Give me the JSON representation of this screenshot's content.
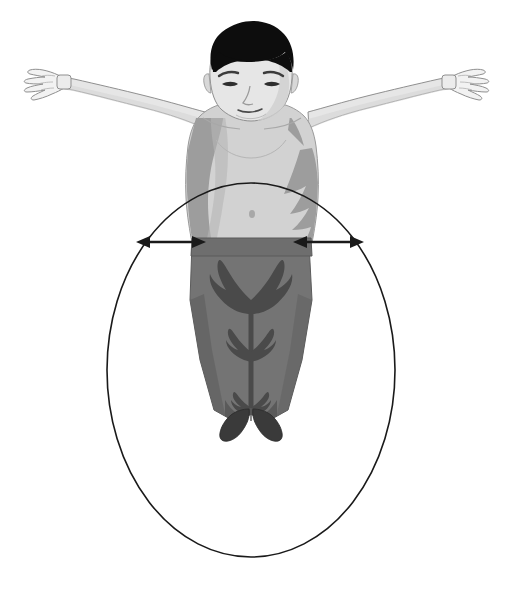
{
  "figure": {
    "alt_text": "Grayscale line illustration of a man with arms outstretched horizontally, bare torso and dark trousers, with an ellipse outlining his lower body and two horizontal double-headed arrows across his hips.",
    "background_color": "#ffffff",
    "outline_color": "#1a1a1a"
  },
  "figure_elements": {
    "person": {
      "label": "man standing with arms outstretched",
      "pose": "T-pose",
      "parts": [
        {
          "name": "hair",
          "label": "Hair",
          "color": "#0d0d0d"
        },
        {
          "name": "face",
          "label": "Face",
          "color": "#e2e2e2"
        },
        {
          "name": "neck",
          "label": "Neck",
          "color": "#c9c9c9"
        },
        {
          "name": "left-arm",
          "label": "Left arm",
          "color": "#e6e6e6"
        },
        {
          "name": "right-arm",
          "label": "Right arm",
          "color": "#e6e6e6"
        },
        {
          "name": "left-hand",
          "label": "Left hand",
          "color": "#f0f0f0"
        },
        {
          "name": "right-hand",
          "label": "Right hand",
          "color": "#f0f0f0"
        },
        {
          "name": "torso",
          "label": "Bare torso",
          "color": "#d2d2d2"
        },
        {
          "name": "torso-shadow",
          "label": "Torso shadow",
          "color": "#9d9d9d"
        },
        {
          "name": "waistband",
          "label": "Waistband",
          "color": "#6e6e6e"
        },
        {
          "name": "trousers",
          "label": "Trousers",
          "color": "#747474"
        },
        {
          "name": "trousers-shadow",
          "label": "Trouser creases",
          "color": "#4a4a4a"
        },
        {
          "name": "shoes",
          "label": "Shoes",
          "color": "#3a3a3a"
        }
      ]
    },
    "ellipse": {
      "label": "Measurement ellipse around lower body",
      "center_x": 251,
      "center_y": 370,
      "radius_x": 144,
      "radius_y": 187,
      "stroke_color": "#1a1a1a",
      "stroke_width": 1.6,
      "fill": "none"
    },
    "arrows": [
      {
        "name": "left-span-arrow",
        "label": "Left horizontal span arrow",
        "x1": 136,
        "x2": 206,
        "y": 242,
        "double_headed": true,
        "color": "#1a1a1a"
      },
      {
        "name": "right-span-arrow",
        "label": "Right horizontal span arrow",
        "x1": 293,
        "x2": 364,
        "y": 242,
        "double_headed": true,
        "color": "#1a1a1a"
      }
    ]
  }
}
